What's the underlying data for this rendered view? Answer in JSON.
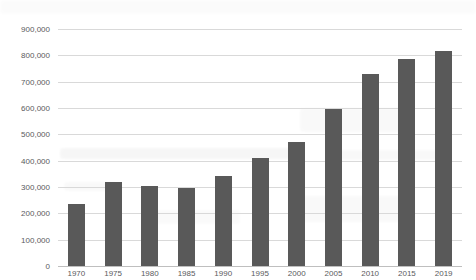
{
  "chart_data": {
    "type": "bar",
    "title": "",
    "subtitle": "",
    "xlabel": "",
    "ylabel": "",
    "categories": [
      "1970",
      "1975",
      "1980",
      "1985",
      "1990",
      "1995",
      "2000",
      "2005",
      "2010",
      "2015",
      "2019"
    ],
    "values": [
      235000,
      320000,
      305000,
      298000,
      342000,
      412000,
      470000,
      598000,
      730000,
      787000,
      818000
    ],
    "ylim": [
      0,
      900000
    ],
    "ytick_values": [
      0,
      100000,
      200000,
      300000,
      400000,
      500000,
      600000,
      700000,
      800000,
      900000
    ],
    "ytick_labels": [
      "0",
      "100,000",
      "200,000",
      "300,000",
      "400,000",
      "500,000",
      "600,000",
      "700,000",
      "800,000",
      "900,000"
    ],
    "grid": true,
    "legend": null,
    "legend_position": "none",
    "series": [
      {
        "name": "",
        "values": [
          235000,
          320000,
          305000,
          298000,
          342000,
          412000,
          470000,
          598000,
          730000,
          787000,
          818000
        ]
      }
    ],
    "colors": {
      "bar": "#595959",
      "gridline": "#d9d9d9",
      "axis": "#bfbfbf",
      "tick_text": "#595959",
      "background": "#ffffff"
    }
  }
}
